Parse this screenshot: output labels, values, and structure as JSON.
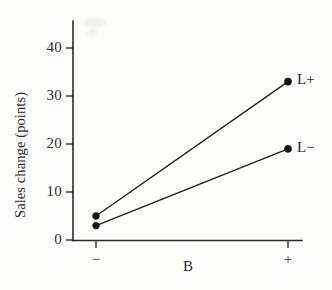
{
  "chart_data": {
    "type": "line",
    "title": "",
    "subtitle": "",
    "xlabel": "B",
    "ylabel": "Sales change (points)",
    "categories": [
      "−",
      "+"
    ],
    "x_tick_labels": [
      "−",
      "+"
    ],
    "y_tick_labels": [
      "0",
      "10",
      "20",
      "30",
      "40"
    ],
    "y_ticks": [
      0,
      10,
      20,
      30,
      40
    ],
    "ylim": [
      0,
      45
    ],
    "grid": false,
    "legend_position": "right-of-endpoints",
    "marker": "filled-circle",
    "series": [
      {
        "name": "L+",
        "label": "L+",
        "values": [
          5,
          33
        ],
        "color": "#141414"
      },
      {
        "name": "L−",
        "label": "L−",
        "values": [
          3,
          19
        ],
        "color": "#141414"
      }
    ],
    "annotations": [
      {
        "text": "L+",
        "series": "L+",
        "at_category": "+"
      },
      {
        "text": "L−",
        "series": "L−",
        "at_category": "+"
      }
    ]
  },
  "axis": {
    "y_label": "Sales change (points)",
    "x_label": "B",
    "y_tick_0": "0",
    "y_tick_10": "10",
    "y_tick_20": "20",
    "y_tick_30": "30",
    "y_tick_40": "40",
    "x_tick_minus": "−",
    "x_tick_plus": "+"
  },
  "labels": {
    "series_high": "L+",
    "series_low": "L−"
  }
}
